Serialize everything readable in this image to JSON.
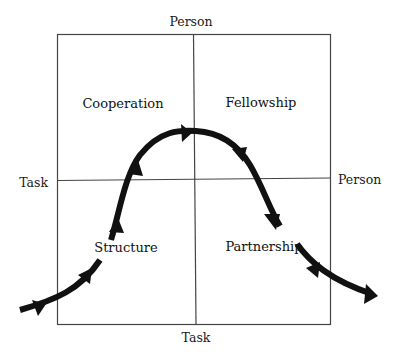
{
  "diagram": {
    "type": "quadrant",
    "axes": {
      "top": "Person",
      "bottom": "Task",
      "left": "Task",
      "right": "Person"
    },
    "quadrants": {
      "top_left": "Cooperation",
      "top_right": "Fellowship",
      "bottom_left": "Structure",
      "bottom_right": "Partnership"
    },
    "curve": {
      "description": "Bell-shaped arrowed path rising from bottom-left through Structure and Cooperation, peaking at the center top, and descending through Fellowship and Partnership to exit bottom-right",
      "direction": "left-to-right",
      "stroke_color": "#111111"
    },
    "colors": {
      "background": "#ffffff",
      "grid_line": "#444444",
      "text": "#1a1a1a"
    }
  }
}
